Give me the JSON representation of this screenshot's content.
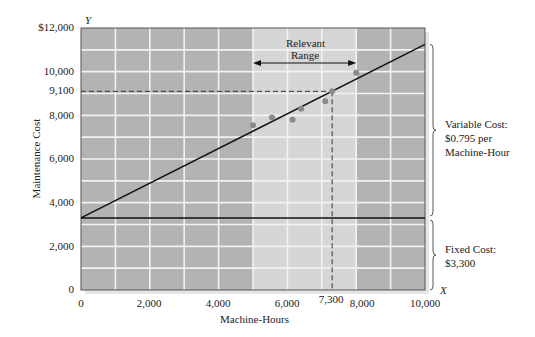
{
  "chart_data": {
    "type": "line",
    "title": "",
    "xlabel": "Machine-Hours",
    "ylabel": "Maintenance Cost",
    "x_axis_letter": "X",
    "y_axis_letter": "Y",
    "xlim": [
      0,
      10000
    ],
    "ylim": [
      0,
      12000
    ],
    "x_ticks": [
      0,
      2000,
      4000,
      6000,
      7300,
      8000,
      10000
    ],
    "x_tick_labels": [
      "0",
      "2,000",
      "4,000",
      "6,000",
      "7,300",
      "8,000",
      "10,000"
    ],
    "y_ticks": [
      0,
      2000,
      4000,
      6000,
      8000,
      9100,
      10000,
      12000
    ],
    "y_tick_labels": [
      "0",
      "2,000",
      "4,000",
      "6,000",
      "8,000",
      "9,100",
      "10,000",
      "$12,000"
    ],
    "grid": true,
    "grid_step_x": 1000,
    "grid_step_y": 1000,
    "relevant_range": {
      "label_line1": "Relevant",
      "label_line2": "Range",
      "from": 5000,
      "to": 8000
    },
    "series": [
      {
        "name": "Total cost line",
        "type": "line",
        "x": [
          0,
          10000
        ],
        "y": [
          3300,
          11250
        ]
      },
      {
        "name": "Fixed cost line",
        "type": "line",
        "x": [
          0,
          10000
        ],
        "y": [
          3300,
          3300
        ]
      },
      {
        "name": "Observations",
        "type": "scatter",
        "x": [
          5000,
          5550,
          6150,
          6400,
          7100,
          7300,
          8000
        ],
        "y": [
          7550,
          7900,
          7800,
          8300,
          8650,
          9100,
          9950
        ]
      }
    ],
    "reference_lines": [
      {
        "type": "dashed",
        "x": 7300,
        "y": 9100
      }
    ],
    "annotations": [
      {
        "text": "Variable Cost: $0.795 per Machine-Hour",
        "range": [
          3300,
          11250
        ]
      },
      {
        "text": "Fixed Cost: $3,300",
        "range": [
          0,
          3300
        ]
      }
    ],
    "colors": {
      "outside_range": "#b3b3b3",
      "relevant_range": "#d6d6d6",
      "grid": "#f2f2f2",
      "line": "#111111",
      "points": "#8a8a8a"
    }
  },
  "labels": {
    "y_letter": "Y",
    "x_letter": "X",
    "ylabel": "Maintenance Cost",
    "xlabel": "Machine-Hours",
    "range1": "Relevant",
    "range2": "Range",
    "var1": "Variable Cost:",
    "var2": "$0.795 per",
    "var3": "Machine-Hour",
    "fix1": "Fixed Cost:",
    "fix2": "$3,300",
    "yt": [
      "$12,000",
      "10,000",
      "9,100",
      "8,000",
      "6,000",
      "4,000",
      "2,000",
      "0"
    ],
    "xt": [
      "0",
      "2,000",
      "4,000",
      "6,000",
      "7,300",
      "8,000",
      "10,000"
    ]
  }
}
